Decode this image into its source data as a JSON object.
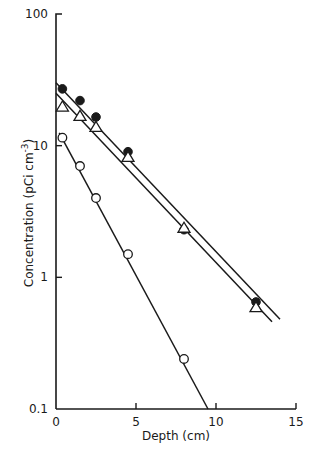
{
  "chart_data": {
    "type": "scatter",
    "title": "",
    "xlabel": "Depth (cm)",
    "ylabel": "Concentration (pCi cm⁻³)",
    "ylabel_main": "Concentration (pCi cm",
    "ylabel_sup": "-3",
    "ylabel_close": ")",
    "yscale": "log",
    "xlim": [
      0,
      15
    ],
    "ylim": [
      0.1,
      100
    ],
    "xticks": [
      0,
      5,
      10,
      15
    ],
    "xtick_labels": [
      "0",
      "5",
      "10",
      "15"
    ],
    "yticks": [
      100,
      10,
      1,
      0.1
    ],
    "ytick_labels": [
      "100",
      "10",
      "1",
      "0.1"
    ],
    "grid": false,
    "legend": null,
    "series": [
      {
        "name": "filled circles",
        "marker": "filled-circle",
        "x": [
          0.4,
          1.5,
          2.5,
          4.5,
          8.0,
          12.5
        ],
        "y": [
          27,
          22,
          16.5,
          9,
          2.3,
          0.65
        ],
        "fit_line": {
          "x": [
            0.0,
            14.0
          ],
          "y": [
            30,
            0.48
          ]
        }
      },
      {
        "name": "open triangles",
        "marker": "open-triangle",
        "x": [
          0.4,
          1.5,
          2.5,
          4.5,
          8.0,
          12.5
        ],
        "y": [
          20,
          17,
          14,
          8.3,
          2.4,
          0.6
        ],
        "fit_line": {
          "x": [
            0.0,
            13.5
          ],
          "y": [
            25,
            0.46
          ]
        }
      },
      {
        "name": "open circles",
        "marker": "open-circle",
        "x": [
          0.4,
          1.5,
          2.5,
          4.5,
          8.0
        ],
        "y": [
          11.5,
          7.0,
          4.0,
          1.5,
          0.24
        ],
        "fit_line": {
          "x": [
            0.2,
            9.5
          ],
          "y": [
            12.5,
            0.1
          ]
        }
      }
    ]
  }
}
